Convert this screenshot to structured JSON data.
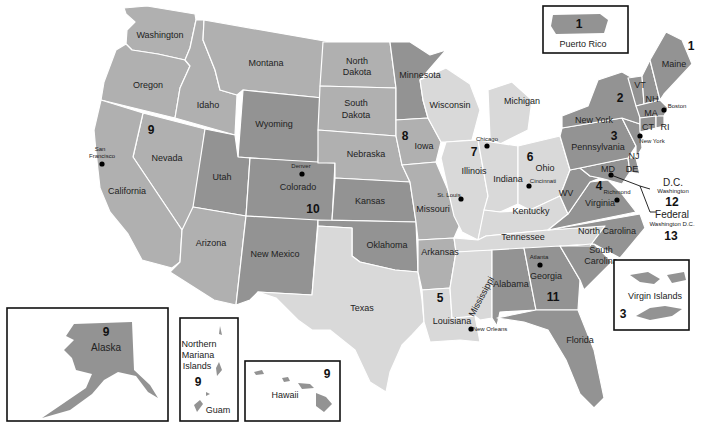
{
  "map": {
    "colors": {
      "light": "#d9d9d9",
      "mid": "#b0b0b0",
      "dark": "#939393",
      "darker": "#858585",
      "border": "#ffffff",
      "inset_border": "#111111"
    },
    "states": {
      "washington": "Washington",
      "oregon": "Oregon",
      "idaho": "Idaho",
      "montana": "Montana",
      "wyoming": "Wyoming",
      "nevada": "Nevada",
      "california": "California",
      "utah": "Utah",
      "colorado": "Colorado",
      "arizona": "Arizona",
      "new_mexico": "New Mexico",
      "north_dakota_1": "North",
      "north_dakota_2": "Dakota",
      "south_dakota_1": "South",
      "south_dakota_2": "Dakota",
      "nebraska": "Nebraska",
      "kansas": "Kansas",
      "oklahoma": "Oklahoma",
      "texas": "Texas",
      "minnesota": "Minnesota",
      "iowa": "Iowa",
      "missouri": "Missouri",
      "arkansas": "Arkansas",
      "louisiana": "Louisiana",
      "wisconsin": "Wisconsin",
      "illinois": "Illinois",
      "michigan": "Michigan",
      "indiana": "Indiana",
      "ohio": "Ohio",
      "kentucky": "Kentucky",
      "tennessee": "Tennessee",
      "mississippi": "Mississippi",
      "alabama": "Alabama",
      "georgia": "Georgia",
      "florida": "Florida",
      "south_carolina_1": "South",
      "south_carolina_2": "Carolina",
      "north_carolina": "North Carolina",
      "virginia": "Virginia",
      "wv": "WV",
      "md": "MD",
      "de": "DE",
      "nj": "NJ",
      "pennsylvania": "Pennsylvania",
      "new_york": "New York",
      "vt": "VT",
      "nh": "NH",
      "ma": "MA",
      "ct": "CT",
      "ri": "RI",
      "maine": "Maine"
    },
    "cities": {
      "san_francisco_1": "San",
      "san_francisco_2": "Francisco",
      "denver": "Denver",
      "chicago": "Chicago",
      "st_louis": "St. Louis",
      "cincinnati": "Cincinnati",
      "new_orleans": "New Orleans",
      "atlanta": "Atlanta",
      "richmond": "Richmond",
      "boston": "Boston",
      "new_york": "New York"
    },
    "regions": {
      "r1_maine": "1",
      "r1_pr": "1",
      "r2": "2",
      "r3_pa": "3",
      "r3_vi": "3",
      "r4": "4",
      "r5": "5",
      "r6": "6",
      "r7": "7",
      "r8": "8",
      "r9_nv": "9",
      "r9_ak": "9",
      "r9_hi": "9",
      "r9_nmi": "9",
      "r10": "10",
      "r11": "11",
      "r12": "12",
      "r13": "13"
    },
    "callouts": {
      "dc_title": "D.C.",
      "dc_sub": "Washington",
      "federal_title": "Federal",
      "federal_sub": "Washington D.C."
    },
    "insets": {
      "puerto_rico": "Puerto Rico",
      "virgin_islands": "Virgin Islands",
      "alaska": "Alaska",
      "nmi_1": "Northern",
      "nmi_2": "Mariana",
      "nmi_3": "Islands",
      "guam": "Guam",
      "hawaii": "Hawaii"
    }
  }
}
